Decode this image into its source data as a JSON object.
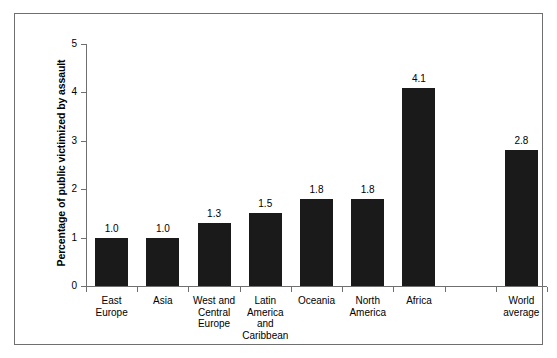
{
  "chart_data": {
    "type": "bar",
    "title": "",
    "subtitle": "",
    "xlabel": "",
    "ylabel": "Percentage of public victimized by assault",
    "ylim": [
      0,
      5
    ],
    "yticks": [
      "0",
      "1",
      "2",
      "3",
      "4",
      "5"
    ],
    "grid": false,
    "legend": null,
    "bar_color": "#1a1a1a",
    "axis_color": "#6f6f6f",
    "categories": [
      "East Europe",
      "Asia",
      "West and Central Europe",
      "Latin America and Caribbean",
      "Oceania",
      "North America",
      "Africa",
      "",
      "World average"
    ],
    "values": [
      1.0,
      1.0,
      1.3,
      1.5,
      1.8,
      1.8,
      4.1,
      null,
      2.8
    ],
    "value_labels": [
      "1.0",
      "1.0",
      "1.3",
      "1.5",
      "1.8",
      "1.8",
      "4.1",
      "",
      "2.8"
    ],
    "category_lines": [
      [
        "East",
        "Europe"
      ],
      [
        "Asia"
      ],
      [
        "West and",
        "Central",
        "Europe"
      ],
      [
        "Latin",
        "America",
        "and",
        "Caribbean"
      ],
      [
        "Oceania"
      ],
      [
        "North",
        "America"
      ],
      [
        "Africa"
      ],
      [],
      [
        "World",
        "average"
      ]
    ]
  }
}
